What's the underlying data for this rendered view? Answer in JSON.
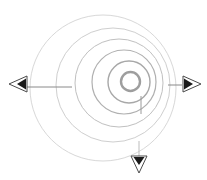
{
  "diagram": {
    "background_color": "#ffffff",
    "canvas": {
      "width": 207,
      "height": 180
    },
    "rings": [
      {
        "name": "outer-ring",
        "cx": 103.0,
        "cy": 88.0,
        "r": 73.0,
        "stroke": "#d8d8d8",
        "stroke_width": 1.0
      },
      {
        "name": "ring-2",
        "cx": 113.0,
        "cy": 85.0,
        "r": 57.0,
        "stroke": "#cfcfcf",
        "stroke_width": 1.0
      },
      {
        "name": "ring-3",
        "cx": 119.0,
        "cy": 83.0,
        "r": 44.0,
        "stroke": "#c0c0c0",
        "stroke_width": 1.0
      },
      {
        "name": "ring-4",
        "cx": 124.0,
        "cy": 82.0,
        "r": 32.0,
        "stroke": "#b0b0b0",
        "stroke_width": 1.2
      },
      {
        "name": "ring-5",
        "cx": 129.0,
        "cy": 82.0,
        "r": 21.0,
        "stroke": "#a8a8a8",
        "stroke_width": 1.4
      },
      {
        "name": "inner-ring",
        "cx": 130.5,
        "cy": 81.5,
        "r": 9.5,
        "stroke": "#9e9e9e",
        "stroke_width": 2.4
      }
    ],
    "radial_lines": [
      {
        "name": "radial-line-left",
        "x1": 27.0,
        "y1": 87.0,
        "x2": 72.0,
        "y2": 87.0,
        "stroke": "#8a8a8a",
        "stroke_width": 1.0
      },
      {
        "name": "radial-line-right",
        "x1": 168.0,
        "y1": 85.0,
        "x2": 182.0,
        "y2": 85.0,
        "stroke": "#8a8a8a",
        "stroke_width": 1.0
      },
      {
        "name": "radial-line-bottom-inner",
        "x1": 141.0,
        "y1": 96.0,
        "x2": 141.0,
        "y2": 114.0,
        "stroke": "#9a9a9a",
        "stroke_width": 1.0
      },
      {
        "name": "radial-line-bottom-outer",
        "x1": 139.0,
        "y1": 141.0,
        "x2": 139.0,
        "y2": 156.0,
        "stroke": "#bdbdbd",
        "stroke_width": 1.0
      }
    ],
    "markers": [
      {
        "name": "marker-left",
        "direction": "left",
        "cx": 19.0,
        "cy": 84.0,
        "outline_color": "#4a4a4a",
        "fill_color": "#1a1a1a",
        "icon": "triangle-left-icon"
      },
      {
        "name": "marker-right",
        "direction": "right",
        "cx": 191.0,
        "cy": 84.0,
        "outline_color": "#4a4a4a",
        "fill_color": "#1a1a1a",
        "icon": "triangle-right-icon"
      },
      {
        "name": "marker-bottom",
        "direction": "down",
        "cx": 139.0,
        "cy": 164.0,
        "outline_color": "#4a4a4a",
        "fill_color": "#1a1a1a",
        "icon": "triangle-down-icon"
      }
    ]
  }
}
